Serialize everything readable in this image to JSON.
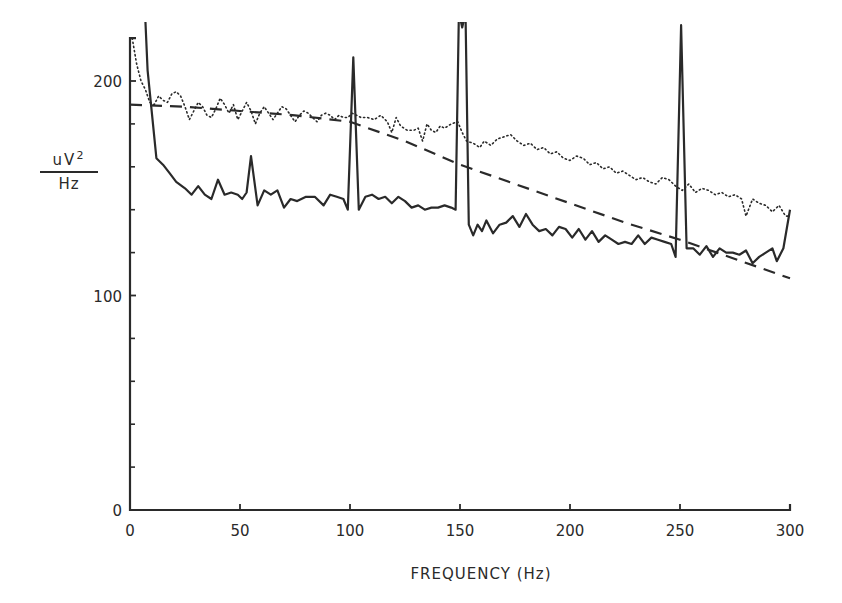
{
  "chart_data": {
    "type": "line",
    "title": "",
    "xlabel": "FREQUENCY (Hz)",
    "ylabel": {
      "numerator": "uV",
      "superscript": "2",
      "denominator": "Hz"
    },
    "xlim": [
      0,
      300
    ],
    "ylim": [
      0,
      220
    ],
    "x_ticks": [
      0,
      50,
      100,
      150,
      200,
      250,
      300
    ],
    "x_tick_labels": [
      "0",
      "50",
      "100",
      "150",
      "200",
      "250",
      "300"
    ],
    "y_ticks_major": [
      0,
      100,
      200
    ],
    "y_tick_labels": [
      "0",
      "100",
      "200"
    ],
    "y_ticks_minor": [
      20,
      40,
      60,
      80,
      120,
      140,
      160,
      180
    ],
    "grid": false,
    "legend": null,
    "series": [
      {
        "name": "solid",
        "style": "solid",
        "points": [
          [
            7,
            228
          ],
          [
            8,
            205
          ],
          [
            12,
            164
          ],
          [
            15,
            161
          ],
          [
            18,
            157
          ],
          [
            21,
            153
          ],
          [
            25,
            150
          ],
          [
            28,
            147
          ],
          [
            31,
            151
          ],
          [
            34,
            147
          ],
          [
            37,
            145
          ],
          [
            40,
            154
          ],
          [
            43,
            147
          ],
          [
            46,
            148
          ],
          [
            49,
            147
          ],
          [
            51,
            145
          ],
          [
            53,
            148
          ],
          [
            55,
            165
          ],
          [
            58,
            142
          ],
          [
            61,
            149
          ],
          [
            64,
            147
          ],
          [
            67,
            149
          ],
          [
            70,
            141
          ],
          [
            73,
            145
          ],
          [
            76,
            144
          ],
          [
            80,
            146
          ],
          [
            84,
            146
          ],
          [
            88,
            142
          ],
          [
            91,
            147
          ],
          [
            94,
            146
          ],
          [
            97,
            145
          ],
          [
            99,
            140
          ],
          [
            101.5,
            211
          ],
          [
            104,
            140
          ],
          [
            107,
            146
          ],
          [
            110,
            147
          ],
          [
            113,
            145
          ],
          [
            116,
            146
          ],
          [
            119,
            143
          ],
          [
            122,
            146
          ],
          [
            125,
            144
          ],
          [
            128,
            141
          ],
          [
            131,
            142
          ],
          [
            134,
            140
          ],
          [
            137,
            141
          ],
          [
            140,
            141
          ],
          [
            143,
            142
          ],
          [
            146,
            141
          ],
          [
            148,
            140
          ],
          [
            149.5,
            232
          ],
          [
            151,
            225
          ],
          [
            152.5,
            232
          ],
          [
            154,
            133
          ],
          [
            156,
            128
          ],
          [
            158,
            133
          ],
          [
            160,
            130
          ],
          [
            162,
            135
          ],
          [
            165,
            129
          ],
          [
            168,
            133
          ],
          [
            171,
            134
          ],
          [
            174,
            137
          ],
          [
            177,
            132
          ],
          [
            180,
            138
          ],
          [
            183,
            133
          ],
          [
            186,
            130
          ],
          [
            189,
            131
          ],
          [
            192,
            128
          ],
          [
            195,
            132
          ],
          [
            198,
            131
          ],
          [
            201,
            127
          ],
          [
            204,
            131
          ],
          [
            207,
            126
          ],
          [
            210,
            130
          ],
          [
            213,
            125
          ],
          [
            216,
            128
          ],
          [
            219,
            126
          ],
          [
            222,
            124
          ],
          [
            225,
            125
          ],
          [
            228,
            124
          ],
          [
            231,
            128
          ],
          [
            234,
            124
          ],
          [
            237,
            127
          ],
          [
            240,
            126
          ],
          [
            243,
            125
          ],
          [
            246,
            124
          ],
          [
            248,
            118
          ],
          [
            250.5,
            226
          ],
          [
            253,
            122
          ],
          [
            256,
            122
          ],
          [
            259,
            119
          ],
          [
            262,
            123
          ],
          [
            265,
            118
          ],
          [
            268,
            122
          ],
          [
            271,
            120
          ],
          [
            274,
            120
          ],
          [
            277,
            119
          ],
          [
            280,
            121
          ],
          [
            283,
            115
          ],
          [
            286,
            118
          ],
          [
            289,
            120
          ],
          [
            292,
            122
          ],
          [
            294,
            116
          ],
          [
            297,
            122
          ],
          [
            300,
            140
          ]
        ]
      },
      {
        "name": "dotted",
        "style": "dotted",
        "points": [
          [
            1,
            220
          ],
          [
            3,
            208
          ],
          [
            5,
            200
          ],
          [
            7,
            196
          ],
          [
            9,
            190
          ],
          [
            11,
            189
          ],
          [
            13,
            193
          ],
          [
            15,
            191
          ],
          [
            17,
            190
          ],
          [
            19,
            194
          ],
          [
            21,
            195
          ],
          [
            23,
            193
          ],
          [
            25,
            188
          ],
          [
            27,
            182
          ],
          [
            29,
            186
          ],
          [
            31,
            190
          ],
          [
            33,
            188
          ],
          [
            35,
            184
          ],
          [
            37,
            183
          ],
          [
            39,
            187
          ],
          [
            41,
            192
          ],
          [
            43,
            189
          ],
          [
            45,
            185
          ],
          [
            47,
            189
          ],
          [
            49,
            182
          ],
          [
            51,
            186
          ],
          [
            53,
            190
          ],
          [
            55,
            186
          ],
          [
            57,
            180
          ],
          [
            59,
            185
          ],
          [
            61,
            188
          ],
          [
            63,
            185
          ],
          [
            65,
            182
          ],
          [
            67,
            185
          ],
          [
            69,
            188
          ],
          [
            71,
            187
          ],
          [
            73,
            184
          ],
          [
            75,
            181
          ],
          [
            77,
            184
          ],
          [
            79,
            186
          ],
          [
            81,
            185
          ],
          [
            83,
            183
          ],
          [
            85,
            181
          ],
          [
            87,
            184
          ],
          [
            89,
            185
          ],
          [
            91,
            184
          ],
          [
            93,
            182
          ],
          [
            95,
            184
          ],
          [
            97,
            183
          ],
          [
            99,
            183
          ],
          [
            101,
            185
          ],
          [
            103,
            184
          ],
          [
            105,
            183
          ],
          [
            108,
            183
          ],
          [
            111,
            182
          ],
          [
            114,
            184
          ],
          [
            117,
            181
          ],
          [
            119,
            176
          ],
          [
            121,
            183
          ],
          [
            123,
            179
          ],
          [
            126,
            177
          ],
          [
            129,
            177
          ],
          [
            131,
            178
          ],
          [
            133,
            172
          ],
          [
            135,
            180
          ],
          [
            137,
            177
          ],
          [
            139,
            176
          ],
          [
            141,
            179
          ],
          [
            143,
            178
          ],
          [
            146,
            180
          ],
          [
            149,
            181
          ],
          [
            151,
            176
          ],
          [
            153,
            172
          ],
          [
            156,
            171
          ],
          [
            159,
            169
          ],
          [
            161,
            172
          ],
          [
            164,
            170
          ],
          [
            167,
            173
          ],
          [
            170,
            174
          ],
          [
            173,
            175
          ],
          [
            176,
            172
          ],
          [
            179,
            170
          ],
          [
            182,
            171
          ],
          [
            185,
            168
          ],
          [
            188,
            169
          ],
          [
            191,
            166
          ],
          [
            194,
            167
          ],
          [
            197,
            164
          ],
          [
            200,
            163
          ],
          [
            203,
            165
          ],
          [
            206,
            164
          ],
          [
            209,
            161
          ],
          [
            212,
            162
          ],
          [
            215,
            159
          ],
          [
            218,
            160
          ],
          [
            221,
            157
          ],
          [
            224,
            158
          ],
          [
            227,
            156
          ],
          [
            230,
            154
          ],
          [
            233,
            155
          ],
          [
            236,
            153
          ],
          [
            239,
            152
          ],
          [
            242,
            155
          ],
          [
            245,
            154
          ],
          [
            248,
            151
          ],
          [
            251,
            149
          ],
          [
            254,
            152
          ],
          [
            257,
            148
          ],
          [
            260,
            150
          ],
          [
            263,
            149
          ],
          [
            266,
            147
          ],
          [
            269,
            148
          ],
          [
            272,
            146
          ],
          [
            275,
            147
          ],
          [
            278,
            145
          ],
          [
            280,
            137
          ],
          [
            283,
            145
          ],
          [
            286,
            143
          ],
          [
            289,
            142
          ],
          [
            292,
            139
          ],
          [
            295,
            142
          ],
          [
            298,
            137
          ],
          [
            300,
            137
          ]
        ]
      },
      {
        "name": "dashed",
        "style": "dashed",
        "points": [
          [
            0,
            189
          ],
          [
            25,
            188
          ],
          [
            50,
            186
          ],
          [
            75,
            184
          ],
          [
            100,
            181
          ],
          [
            125,
            172
          ],
          [
            150,
            161
          ],
          [
            175,
            152
          ],
          [
            200,
            143
          ],
          [
            225,
            134
          ],
          [
            250,
            126
          ],
          [
            275,
            117
          ],
          [
            300,
            108
          ]
        ]
      }
    ]
  },
  "layout": {
    "x0_px": 130,
    "px_per_x": 2.2,
    "y0_px": 510,
    "px_per_y": 2.145,
    "ink": "#2a2a2a"
  }
}
